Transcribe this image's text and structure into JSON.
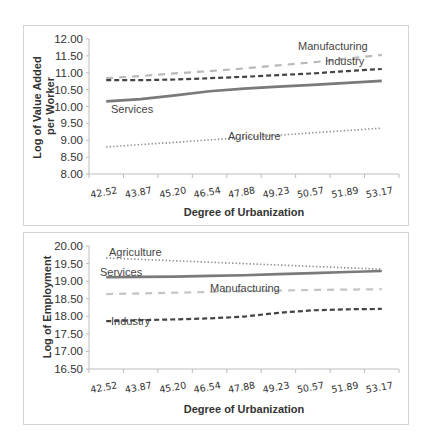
{
  "chart_data": [
    {
      "type": "line",
      "title": "",
      "xlabel": "Degree of Urbanization",
      "ylabel": "Log of Value Added per Worker",
      "ylabel_lines": [
        "Log of Value Added",
        "per Worker"
      ],
      "categories": [
        "42.52",
        "43.87",
        "45.20",
        "46.54",
        "47.88",
        "49.23",
        "50.57",
        "51.89",
        "53.17"
      ],
      "y_ticks": [
        "8.00",
        "8.50",
        "9.00",
        "9.50",
        "10.00",
        "10.50",
        "11.00",
        "11.50",
        "12.00"
      ],
      "ylim": [
        8.0,
        12.0
      ],
      "grid": false,
      "legend": "inline labels",
      "series": [
        {
          "name": "Manufacturing",
          "style": "dashed-light",
          "color": "#b8b8b8",
          "values": [
            10.84,
            10.9,
            10.98,
            11.05,
            11.13,
            11.22,
            11.31,
            11.42,
            11.53
          ]
        },
        {
          "name": "Industry",
          "style": "dashed-dark",
          "color": "#444444",
          "values": [
            10.78,
            10.78,
            10.8,
            10.84,
            10.88,
            10.93,
            10.98,
            11.05,
            11.11
          ]
        },
        {
          "name": "Services",
          "style": "solid",
          "color": "#7a7a7a",
          "values": [
            10.15,
            10.22,
            10.33,
            10.45,
            10.53,
            10.59,
            10.64,
            10.7,
            10.76
          ]
        },
        {
          "name": "Agriculture",
          "style": "dotted",
          "color": "#888888",
          "values": [
            8.8,
            8.87,
            8.94,
            9.01,
            9.08,
            9.15,
            9.22,
            9.29,
            9.36
          ]
        }
      ]
    },
    {
      "type": "line",
      "title": "",
      "xlabel": "Degree of Urbanization",
      "ylabel": "Log of Employment",
      "ylabel_lines": [
        "Log of Employment"
      ],
      "categories": [
        "42.52",
        "43.87",
        "45.20",
        "46.54",
        "47.88",
        "49.23",
        "50.57",
        "51.89",
        "53.17"
      ],
      "y_ticks": [
        "16.50",
        "17.00",
        "17.50",
        "18.00",
        "18.50",
        "19.00",
        "19.50",
        "20.00"
      ],
      "ylim": [
        16.5,
        20.0
      ],
      "grid": false,
      "legend": "inline labels",
      "series": [
        {
          "name": "Agriculture",
          "style": "dotted",
          "color": "#888888",
          "values": [
            19.66,
            19.62,
            19.58,
            19.54,
            19.5,
            19.46,
            19.42,
            19.38,
            19.34
          ]
        },
        {
          "name": "Services",
          "style": "solid",
          "color": "#7a7a7a",
          "values": [
            19.11,
            19.12,
            19.13,
            19.15,
            19.17,
            19.2,
            19.23,
            19.26,
            19.29
          ]
        },
        {
          "name": "Manufacturing",
          "style": "dashed-light",
          "color": "#c4c4c4",
          "values": [
            18.63,
            18.65,
            18.67,
            18.69,
            18.71,
            18.73,
            18.75,
            18.76,
            18.77
          ]
        },
        {
          "name": "Industry",
          "style": "dashed-dark",
          "color": "#444444",
          "values": [
            17.86,
            17.89,
            17.91,
            17.94,
            17.99,
            18.1,
            18.17,
            18.2,
            18.21
          ]
        }
      ]
    }
  ],
  "labels": {
    "top": {
      "manufacturing": "Manufacturing",
      "industry": "Industry",
      "services": "Services",
      "agriculture": "Agriculture",
      "xlabel": "Degree of Urbanization",
      "ylabel_line1": "Log of Value Added",
      "ylabel_line2": "per Worker"
    },
    "bottom": {
      "agriculture": "Agriculture",
      "services": "Services",
      "manufacturing": "Manufacturing",
      "industry": "Industry",
      "xlabel": "Degree of Urbanization",
      "ylabel": "Log of Employment"
    }
  }
}
